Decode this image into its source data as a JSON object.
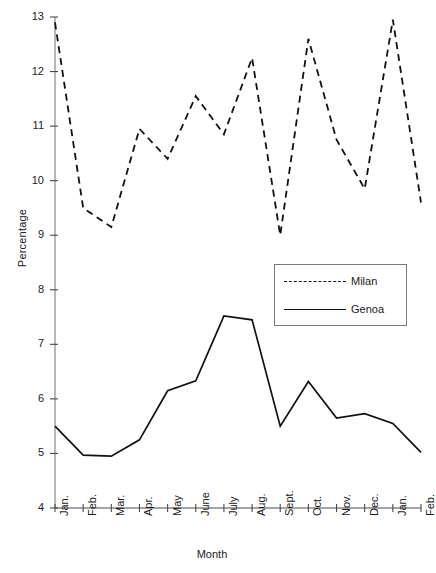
{
  "chart_data": {
    "type": "line",
    "title": "",
    "xlabel": "Month",
    "ylabel": "Percentage",
    "ylim": [
      4,
      13
    ],
    "yticks": [
      4,
      5,
      6,
      7,
      8,
      9,
      10,
      11,
      12,
      13
    ],
    "grid": false,
    "legend_position": "center-right",
    "categories": [
      "Jan.",
      "Feb.",
      "Mar.",
      "Apr.",
      "May",
      "June",
      "July",
      "Aug.",
      "Sept.",
      "Oct.",
      "Nov.",
      "Dec.",
      "Jan.",
      "Feb."
    ],
    "series": [
      {
        "name": "Milan",
        "style": "dashed",
        "color": "#111111",
        "values": [
          12.9,
          9.5,
          9.15,
          10.95,
          10.4,
          11.55,
          10.85,
          12.25,
          9.0,
          12.6,
          10.75,
          9.85,
          12.95,
          9.6
        ]
      },
      {
        "name": "Genoa",
        "style": "solid",
        "color": "#111111",
        "values": [
          5.5,
          4.97,
          4.95,
          5.25,
          6.15,
          6.33,
          7.52,
          7.45,
          5.5,
          6.32,
          5.65,
          5.73,
          5.55,
          5.02
        ]
      }
    ]
  },
  "axes": {
    "y_title": "Percentage",
    "x_title": "Month"
  },
  "legend": {
    "entries": [
      {
        "label": "Milan",
        "style": "dashed"
      },
      {
        "label": "Genoa",
        "style": "solid"
      }
    ]
  }
}
